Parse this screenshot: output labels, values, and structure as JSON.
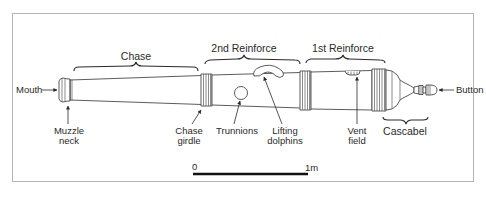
{
  "diagram": {
    "colors": {
      "ink": "#2a2a2a",
      "frame": "#b4b4b4",
      "background": "#ffffff"
    },
    "section_labels": {
      "chase": "Chase",
      "second_reinforce": "2nd Reinforce",
      "first_reinforce": "1st Reinforce",
      "cascabel": "Cascabel"
    },
    "part_labels": {
      "mouth": "Mouth",
      "button": "Button",
      "muzzle_neck": [
        "Muzzle",
        "neck"
      ],
      "chase_girdle": [
        "Chase",
        "girdle"
      ],
      "trunnions": "Trunnions",
      "lifting_dolphins": [
        "Lifting",
        "dolphins"
      ],
      "vent_field": [
        "Vent",
        "field"
      ]
    },
    "scale_bar": {
      "start_label": "0",
      "end_label": "1m",
      "length_m": 1
    }
  }
}
